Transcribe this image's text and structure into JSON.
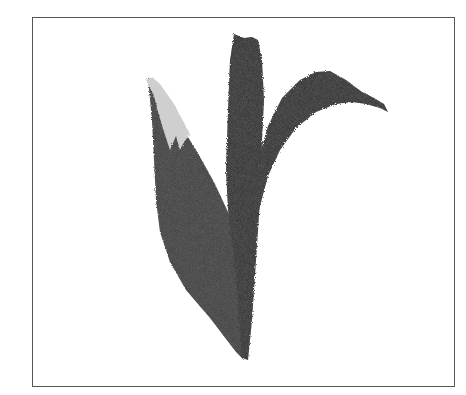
{
  "image": {
    "subject": "brush-painted plant leaves",
    "description": "Ink/charcoal painting of three dark leaves rising from a single base, with a light grey tip on the leftmost leaf, inside a thin rectangular frame",
    "colors": {
      "frame": "#555555",
      "background": "#ffffff",
      "leaf_dark": "#2a2a2a",
      "leaf_mid": "#3f3f3f",
      "leaf_tip_light": "#cfcfcf"
    }
  }
}
